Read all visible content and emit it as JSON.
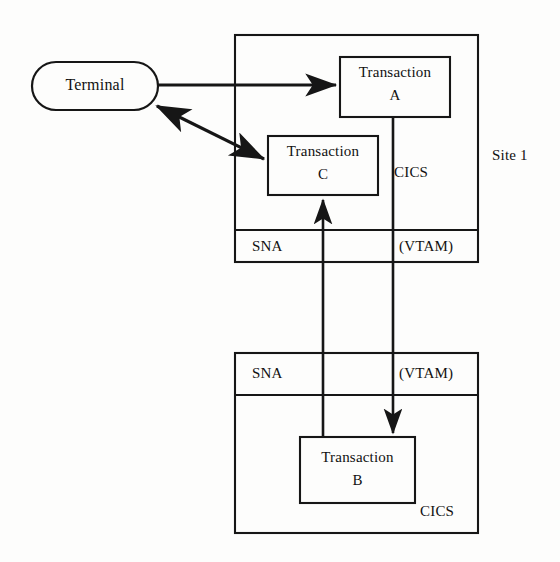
{
  "diagram": {
    "stroke_color": "#161616",
    "background_color": "#fdfdfc",
    "nodes": {
      "terminal": {
        "label": "Terminal",
        "shape": "stadium"
      },
      "transaction_a": {
        "label_line1": "Transaction",
        "label_line2": "A",
        "shape": "rect"
      },
      "transaction_c": {
        "label_line1": "Transaction",
        "label_line2": "C",
        "shape": "rect"
      },
      "transaction_b": {
        "label_line1": "Transaction",
        "label_line2": "B",
        "shape": "rect"
      }
    },
    "sites": [
      {
        "id": "site-1",
        "outer_label": "Site 1",
        "region_label": "CICS",
        "bands": [
          {
            "id": "sna-top",
            "label": "SNA"
          },
          {
            "id": "vtam-top",
            "label": "(VTAM)"
          }
        ]
      },
      {
        "id": "site-2",
        "outer_label": "",
        "region_label": "CICS",
        "bands": [
          {
            "id": "sna-bottom",
            "label": "SNA"
          },
          {
            "id": "vtam-bottom",
            "label": "(VTAM)"
          }
        ]
      }
    ],
    "connectors": [
      {
        "id": "terminal-to-a",
        "from": "terminal",
        "to": "transaction_a",
        "arrow": "single"
      },
      {
        "id": "terminal-to-c",
        "from": "terminal",
        "to": "transaction_c",
        "arrow": "double"
      },
      {
        "id": "a-to-b",
        "from": "transaction_a",
        "to": "transaction_b",
        "arrow": "single-down"
      },
      {
        "id": "b-to-c",
        "from": "transaction_b",
        "to": "transaction_c",
        "arrow": "single-up"
      }
    ]
  }
}
